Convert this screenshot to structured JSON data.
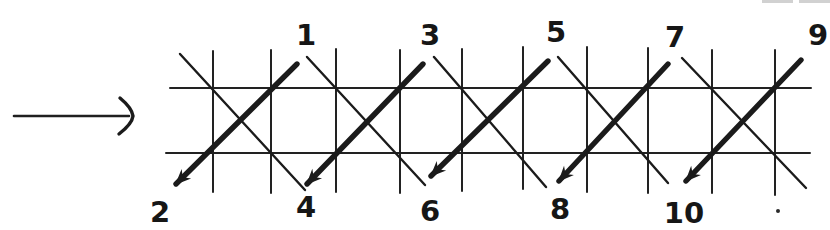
{
  "figure": {
    "background": "#ffffff",
    "ink": "#1b1b1b",
    "lead_arrow": {
      "x1": 14,
      "y1": 116,
      "x2": 129,
      "y2": 116,
      "head_path": "M120,98 Q132,108 133,116 Q132,124 119,134"
    },
    "grid": {
      "h_lines": [
        {
          "x1": 170,
          "y1": 88,
          "x2": 811,
          "y2": 88
        },
        {
          "x1": 166,
          "y1": 153,
          "x2": 810,
          "y2": 153
        }
      ],
      "v_lines": [
        {
          "x": 213,
          "y1": 51,
          "y2": 192
        },
        {
          "x": 271,
          "y1": 50,
          "y2": 193
        },
        {
          "x": 336,
          "y1": 49,
          "y2": 192
        },
        {
          "x": 400,
          "y1": 50,
          "y2": 193
        },
        {
          "x": 462,
          "y1": 49,
          "y2": 191
        },
        {
          "x": 523,
          "y1": 47,
          "y2": 189
        },
        {
          "x": 587,
          "y1": 47,
          "y2": 192
        },
        {
          "x": 648,
          "y1": 48,
          "y2": 193
        },
        {
          "x": 712,
          "y1": 50,
          "y2": 193
        },
        {
          "x": 775,
          "y1": 50,
          "y2": 195
        }
      ]
    },
    "cross_lines": [
      {
        "x1": 180,
        "y1": 54,
        "x2": 305,
        "y2": 190
      },
      {
        "x1": 307,
        "y1": 57,
        "x2": 425,
        "y2": 185
      },
      {
        "x1": 434,
        "y1": 57,
        "x2": 546,
        "y2": 187
      },
      {
        "x1": 558,
        "y1": 57,
        "x2": 668,
        "y2": 183
      },
      {
        "x1": 682,
        "y1": 58,
        "x2": 806,
        "y2": 188
      }
    ],
    "step_arrows": [
      {
        "from": "1",
        "to": "2",
        "x1": 297,
        "y1": 64,
        "x2": 176,
        "y2": 184
      },
      {
        "from": "3",
        "to": "4",
        "x1": 423,
        "y1": 64,
        "x2": 307,
        "y2": 184
      },
      {
        "from": "5",
        "to": "6",
        "x1": 548,
        "y1": 61,
        "x2": 431,
        "y2": 176
      },
      {
        "from": "7",
        "to": "8",
        "x1": 668,
        "y1": 64,
        "x2": 559,
        "y2": 181
      },
      {
        "from": "9",
        "to": "10",
        "x1": 801,
        "y1": 60,
        "x2": 686,
        "y2": 181
      }
    ],
    "top_labels": [
      {
        "text": "1",
        "x": 306,
        "y": 45
      },
      {
        "text": "3",
        "x": 430,
        "y": 45
      },
      {
        "text": "5",
        "x": 556,
        "y": 42
      },
      {
        "text": "7",
        "x": 675,
        "y": 47
      },
      {
        "text": "9",
        "x": 818,
        "y": 45
      }
    ],
    "bottom_labels": [
      {
        "text": "2",
        "x": 160,
        "y": 222
      },
      {
        "text": "4",
        "x": 306,
        "y": 217
      },
      {
        "text": "6",
        "x": 430,
        "y": 221
      },
      {
        "text": "8",
        "x": 560,
        "y": 219
      },
      {
        "text": "10",
        "x": 684,
        "y": 223
      }
    ],
    "marks": {
      "dot": {
        "x": 778,
        "y": 211,
        "r": 2
      },
      "edge_marks": [
        {
          "x": 762,
          "y": 0,
          "w": 31,
          "h": 3
        },
        {
          "x": 799,
          "y": 0,
          "w": 31,
          "h": 3
        }
      ]
    }
  }
}
